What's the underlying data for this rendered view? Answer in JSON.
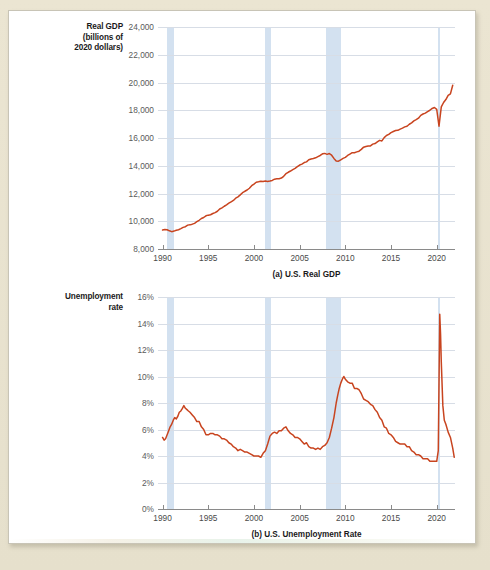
{
  "figure": {
    "panel_background": "#ffffff",
    "page_background": "#e8e2cf",
    "line_color": "#c8441f",
    "recession_band_color": "#cbdced",
    "gridline_color": "#d7dde6"
  },
  "chart_a": {
    "axis_title_lines": [
      "Real GDP",
      "(billions of",
      "2020 dollars)"
    ],
    "caption": "(a) U.S. Real GDP",
    "ylabel": "Real GDP (billions of 2020 dollars)",
    "xlabel": "",
    "yticks": [
      "8,000",
      "10,000",
      "12,000",
      "14,000",
      "16,000",
      "18,000",
      "20,000",
      "22,000",
      "24,000"
    ],
    "xticks": [
      "1990",
      "1995",
      "2000",
      "2005",
      "2010",
      "2015",
      "2020"
    ]
  },
  "chart_b": {
    "axis_title_lines": [
      "Unemployment",
      "rate"
    ],
    "caption": "(b) U.S. Unemployment Rate",
    "ylabel": "Unemployment rate",
    "xlabel": "",
    "yticks": [
      "0%",
      "2%",
      "4%",
      "6%",
      "8%",
      "10%",
      "12%",
      "14%",
      "16%"
    ],
    "xticks": [
      "1990",
      "1995",
      "2000",
      "2005",
      "2010",
      "2015",
      "2020"
    ]
  },
  "chart_data": [
    {
      "type": "line",
      "id": "us-real-gdp",
      "title": "(a) U.S. Real GDP",
      "xlabel": "",
      "ylabel": "Real GDP (billions of 2020 dollars)",
      "xlim": [
        1989.5,
        2022.0
      ],
      "ylim": [
        8000,
        24000
      ],
      "ytick_values": [
        8000,
        10000,
        12000,
        14000,
        16000,
        18000,
        20000,
        22000,
        24000
      ],
      "xtick_values": [
        1990,
        1995,
        2000,
        2005,
        2010,
        2015,
        2020
      ],
      "grid": true,
      "legend": "none",
      "series": [
        {
          "name": "Real GDP",
          "color": "#c8441f",
          "x": [
            1990.0,
            1990.25,
            1990.5,
            1990.75,
            1991.0,
            1991.25,
            1991.5,
            1991.75,
            1992.0,
            1992.25,
            1992.5,
            1992.75,
            1993.0,
            1993.25,
            1993.5,
            1993.75,
            1994.0,
            1994.25,
            1994.5,
            1994.75,
            1995.0,
            1995.25,
            1995.5,
            1995.75,
            1996.0,
            1996.25,
            1996.5,
            1996.75,
            1997.0,
            1997.25,
            1997.5,
            1997.75,
            1998.0,
            1998.25,
            1998.5,
            1998.75,
            1999.0,
            1999.25,
            1999.5,
            1999.75,
            2000.0,
            2000.25,
            2000.5,
            2000.75,
            2001.0,
            2001.25,
            2001.5,
            2001.75,
            2002.0,
            2002.25,
            2002.5,
            2002.75,
            2003.0,
            2003.25,
            2003.5,
            2003.75,
            2004.0,
            2004.25,
            2004.5,
            2004.75,
            2005.0,
            2005.25,
            2005.5,
            2005.75,
            2006.0,
            2006.25,
            2006.5,
            2006.75,
            2007.0,
            2007.25,
            2007.5,
            2007.75,
            2008.0,
            2008.25,
            2008.5,
            2008.75,
            2009.0,
            2009.25,
            2009.5,
            2009.75,
            2010.0,
            2010.25,
            2010.5,
            2010.75,
            2011.0,
            2011.25,
            2011.5,
            2011.75,
            2012.0,
            2012.25,
            2012.5,
            2012.75,
            2013.0,
            2013.25,
            2013.5,
            2013.75,
            2014.0,
            2014.25,
            2014.5,
            2014.75,
            2015.0,
            2015.25,
            2015.5,
            2015.75,
            2016.0,
            2016.25,
            2016.5,
            2016.75,
            2017.0,
            2017.25,
            2017.5,
            2017.75,
            2018.0,
            2018.25,
            2018.5,
            2018.75,
            2019.0,
            2019.25,
            2019.5,
            2019.75,
            2020.0,
            2020.25,
            2020.5,
            2020.75,
            2021.0,
            2021.25,
            2021.5,
            2021.75
          ],
          "y": [
            9370,
            9400,
            9390,
            9310,
            9250,
            9290,
            9350,
            9390,
            9470,
            9560,
            9610,
            9720,
            9740,
            9790,
            9850,
            9970,
            10070,
            10200,
            10270,
            10390,
            10440,
            10470,
            10560,
            10620,
            10720,
            10880,
            10960,
            11080,
            11180,
            11300,
            11400,
            11500,
            11660,
            11760,
            11900,
            12060,
            12160,
            12250,
            12380,
            12560,
            12680,
            12810,
            12840,
            12880,
            12860,
            12900,
            12870,
            12900,
            12940,
            13030,
            13060,
            13070,
            13110,
            13240,
            13430,
            13530,
            13620,
            13720,
            13810,
            13930,
            14050,
            14120,
            14230,
            14280,
            14430,
            14490,
            14520,
            14570,
            14660,
            14740,
            14860,
            14890,
            14820,
            14880,
            14760,
            14530,
            14350,
            14330,
            14430,
            14530,
            14600,
            14740,
            14840,
            14940,
            14940,
            15000,
            15050,
            15180,
            15340,
            15390,
            15430,
            15430,
            15560,
            15600,
            15720,
            15830,
            15790,
            16030,
            16180,
            16260,
            16390,
            16470,
            16540,
            16550,
            16640,
            16710,
            16800,
            16850,
            16990,
            17090,
            17230,
            17320,
            17430,
            17630,
            17730,
            17790,
            17900,
            18000,
            18130,
            18200,
            18060,
            16850,
            18240,
            18560,
            18770,
            19070,
            19180,
            19800
          ]
        }
      ],
      "recession_bands": [
        {
          "start": 1990.5,
          "end": 1991.2
        },
        {
          "start": 2001.2,
          "end": 2001.9
        },
        {
          "start": 2007.9,
          "end": 2009.5
        },
        {
          "start": 2020.1,
          "end": 2020.4
        }
      ]
    },
    {
      "type": "line",
      "id": "us-unemployment-rate",
      "title": "(b) U.S. Unemployment Rate",
      "xlabel": "",
      "ylabel": "Unemployment rate",
      "xlim": [
        1989.5,
        2022.0
      ],
      "ylim": [
        0,
        16
      ],
      "ytick_values": [
        0,
        2,
        4,
        6,
        8,
        10,
        12,
        14,
        16
      ],
      "xtick_values": [
        1990,
        1995,
        2000,
        2005,
        2010,
        2015,
        2020
      ],
      "grid": true,
      "legend": "none",
      "series": [
        {
          "name": "Unemployment rate",
          "color": "#c8441f",
          "x": [
            1990.0,
            1990.17,
            1990.33,
            1990.5,
            1990.67,
            1990.83,
            1991.0,
            1991.17,
            1991.33,
            1991.5,
            1991.67,
            1991.83,
            1992.0,
            1992.17,
            1992.33,
            1992.5,
            1992.67,
            1992.83,
            1993.0,
            1993.25,
            1993.5,
            1993.75,
            1994.0,
            1994.25,
            1994.5,
            1994.75,
            1995.0,
            1995.25,
            1995.5,
            1995.75,
            1996.0,
            1996.25,
            1996.5,
            1996.75,
            1997.0,
            1997.25,
            1997.5,
            1997.75,
            1998.0,
            1998.25,
            1998.5,
            1998.75,
            1999.0,
            1999.25,
            1999.5,
            1999.75,
            2000.0,
            2000.25,
            2000.5,
            2000.75,
            2001.0,
            2001.25,
            2001.5,
            2001.75,
            2002.0,
            2002.25,
            2002.5,
            2002.75,
            2003.0,
            2003.25,
            2003.5,
            2003.75,
            2004.0,
            2004.25,
            2004.5,
            2004.75,
            2005.0,
            2005.25,
            2005.5,
            2005.75,
            2006.0,
            2006.25,
            2006.5,
            2006.75,
            2007.0,
            2007.25,
            2007.5,
            2007.75,
            2008.0,
            2008.25,
            2008.5,
            2008.75,
            2009.0,
            2009.17,
            2009.33,
            2009.5,
            2009.67,
            2009.83,
            2010.0,
            2010.25,
            2010.5,
            2010.75,
            2011.0,
            2011.25,
            2011.5,
            2011.75,
            2012.0,
            2012.25,
            2012.5,
            2012.75,
            2013.0,
            2013.25,
            2013.5,
            2013.75,
            2014.0,
            2014.25,
            2014.5,
            2014.75,
            2015.0,
            2015.25,
            2015.5,
            2015.75,
            2016.0,
            2016.25,
            2016.5,
            2016.75,
            2017.0,
            2017.25,
            2017.5,
            2017.75,
            2018.0,
            2018.25,
            2018.5,
            2018.75,
            2019.0,
            2019.25,
            2019.5,
            2019.75,
            2020.0,
            2020.17,
            2020.33,
            2020.42,
            2020.5,
            2020.67,
            2020.83,
            2021.0,
            2021.25,
            2021.5,
            2021.75,
            2021.92
          ],
          "y": [
            5.4,
            5.2,
            5.3,
            5.6,
            5.9,
            6.2,
            6.4,
            6.7,
            6.9,
            6.8,
            7.0,
            7.3,
            7.4,
            7.6,
            7.8,
            7.6,
            7.5,
            7.4,
            7.3,
            7.1,
            6.9,
            6.6,
            6.6,
            6.2,
            6.0,
            5.6,
            5.6,
            5.7,
            5.7,
            5.6,
            5.6,
            5.5,
            5.3,
            5.3,
            5.2,
            5.0,
            4.9,
            4.7,
            4.6,
            4.4,
            4.5,
            4.4,
            4.3,
            4.3,
            4.2,
            4.1,
            4.0,
            4.0,
            4.0,
            3.9,
            4.2,
            4.4,
            4.9,
            5.5,
            5.7,
            5.8,
            5.7,
            5.9,
            5.9,
            6.1,
            6.2,
            5.9,
            5.7,
            5.6,
            5.4,
            5.4,
            5.3,
            5.1,
            4.9,
            5.0,
            4.7,
            4.6,
            4.6,
            4.5,
            4.6,
            4.5,
            4.7,
            4.8,
            5.0,
            5.4,
            6.1,
            6.9,
            8.0,
            8.6,
            9.1,
            9.5,
            9.8,
            10.0,
            9.8,
            9.6,
            9.5,
            9.5,
            9.1,
            9.1,
            9.0,
            8.7,
            8.3,
            8.2,
            8.1,
            7.9,
            7.8,
            7.5,
            7.3,
            6.9,
            6.7,
            6.2,
            6.1,
            5.7,
            5.6,
            5.4,
            5.1,
            5.0,
            4.9,
            4.9,
            4.9,
            4.7,
            4.7,
            4.4,
            4.3,
            4.1,
            4.1,
            4.0,
            3.8,
            3.8,
            3.8,
            3.6,
            3.6,
            3.6,
            3.6,
            4.4,
            14.7,
            13.2,
            11.1,
            7.8,
            6.7,
            6.4,
            5.8,
            5.4,
            4.6,
            3.9
          ]
        }
      ],
      "recession_bands": [
        {
          "start": 1990.5,
          "end": 1991.2
        },
        {
          "start": 2001.2,
          "end": 2001.9
        },
        {
          "start": 2007.9,
          "end": 2009.5
        },
        {
          "start": 2020.1,
          "end": 2020.4
        }
      ]
    }
  ]
}
